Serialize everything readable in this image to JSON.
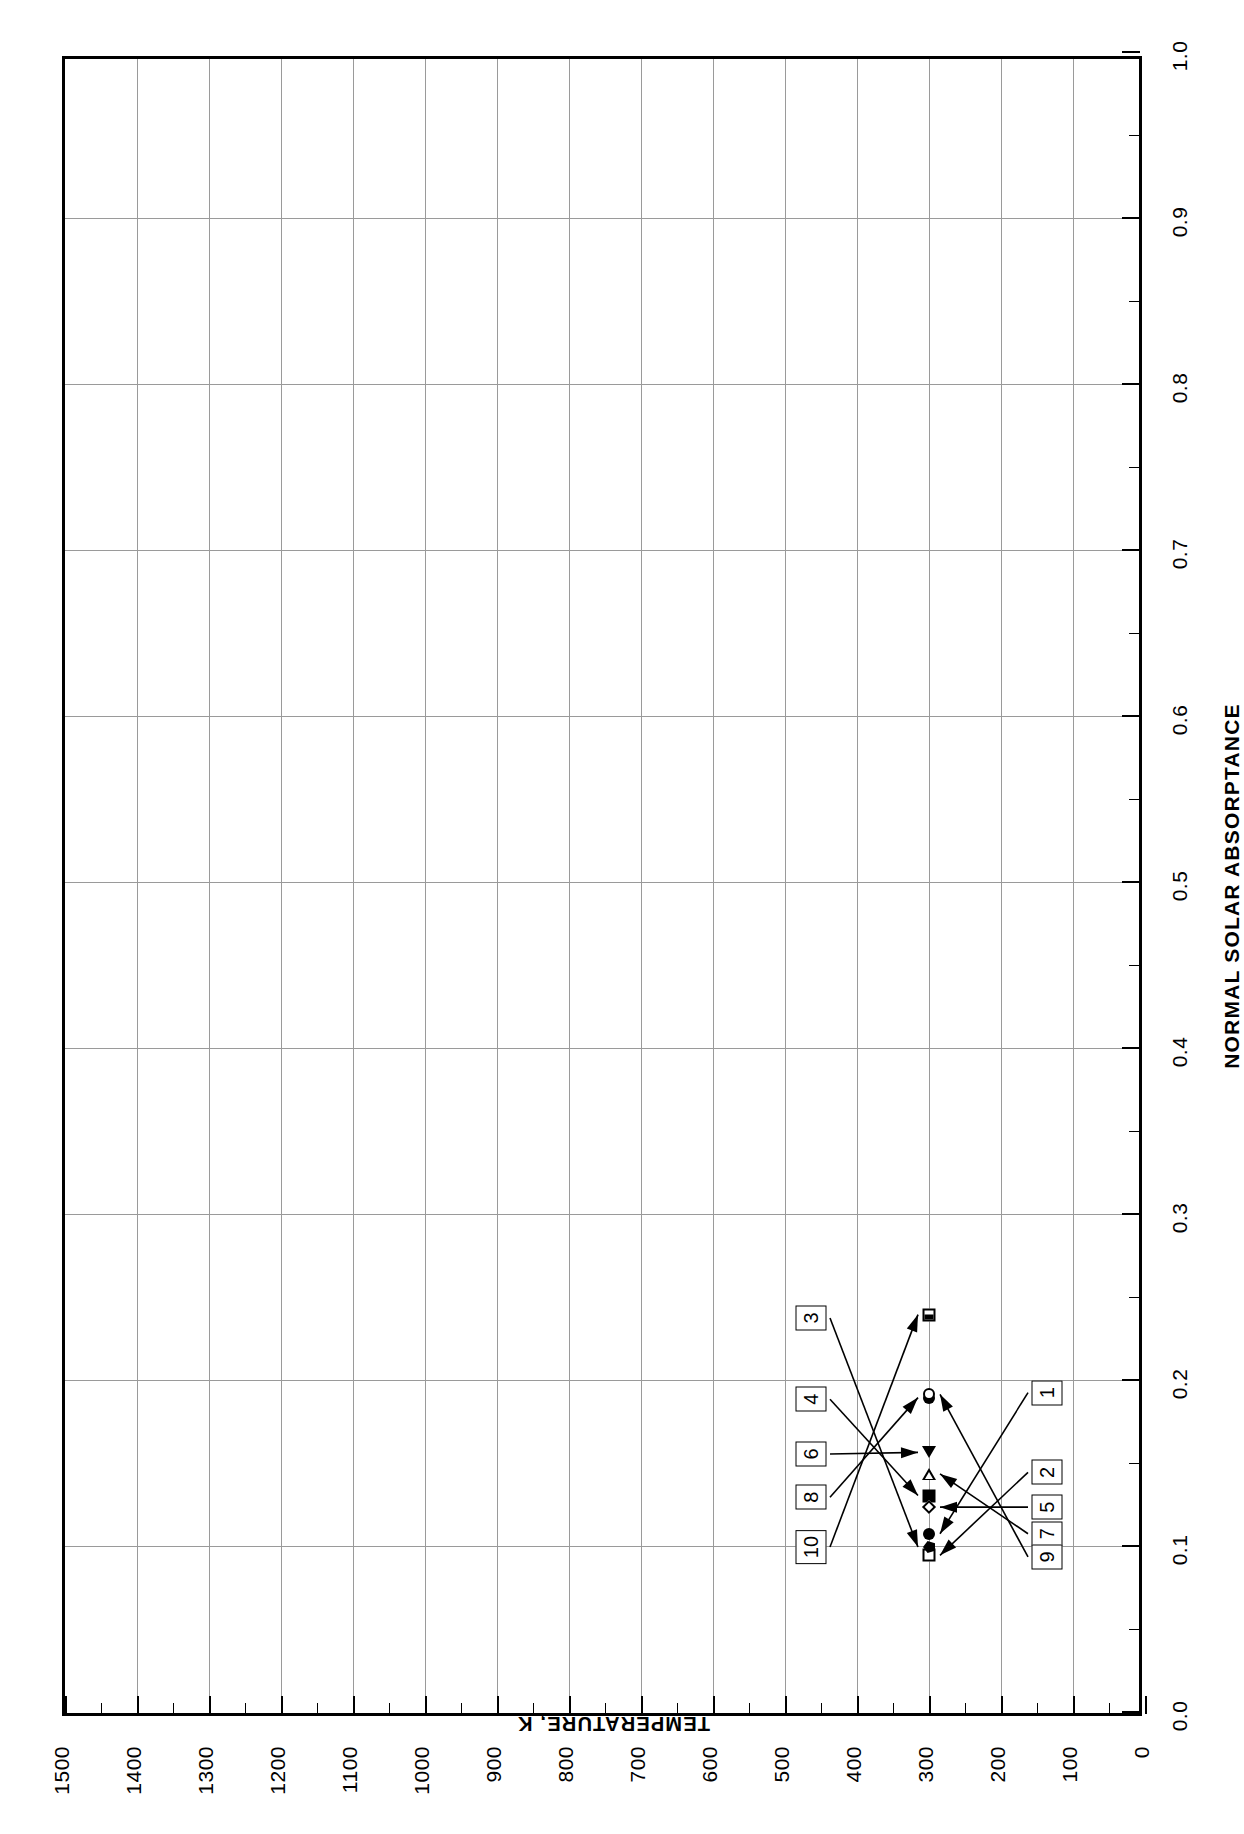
{
  "figure": {
    "number_label": "FIGURE 15",
    "title_lines": [
      "NORMAL",
      "SOLAR",
      "ABSORPTANCE OF",
      "ALUMINUM"
    ]
  },
  "axes": {
    "x_title": "NORMAL SOLAR ABSORPTANCE",
    "y_title": "TEMPERATURE, K",
    "x_tick_labels": [
      "0.0",
      "0.1",
      "0.2",
      "0.3",
      "0.4",
      "0.5",
      "0.6",
      "0.7",
      "0.8",
      "0.9",
      "1.0"
    ],
    "y_tick_labels": [
      "0",
      "100",
      "200",
      "300",
      "400",
      "500",
      "600",
      "700",
      "800",
      "900",
      "1000",
      "1100",
      "1200",
      "1300",
      "1400",
      "1500"
    ]
  },
  "chart_data": {
    "type": "scatter",
    "title": "NORMAL SOLAR ABSORPTANCE OF ALUMINUM",
    "subtitle": "FIGURE 15",
    "xlabel": "NORMAL SOLAR ABSORPTANCE",
    "ylabel": "TEMPERATURE, K",
    "xlim": [
      0.0,
      1.0
    ],
    "ylim": [
      0,
      1500
    ],
    "xticks": [
      0.0,
      0.1,
      0.2,
      0.3,
      0.4,
      0.5,
      0.6,
      0.7,
      0.8,
      0.9,
      1.0
    ],
    "yticks": [
      0,
      100,
      200,
      300,
      400,
      500,
      600,
      700,
      800,
      900,
      1000,
      1100,
      1200,
      1300,
      1400,
      1500
    ],
    "grid": true,
    "legend": "none",
    "orientation": "page rotated 90 degrees; absorptance axis horizontal at page bottom, temperature axis vertical at page right",
    "points": [
      {
        "curve": 1,
        "label": "1",
        "absorptance": 0.108,
        "temperature": 300,
        "marker": "filled-circle",
        "callout_side": "below"
      },
      {
        "curve": 2,
        "label": "2",
        "absorptance": 0.095,
        "temperature": 300,
        "marker": "open-square",
        "callout_side": "below"
      },
      {
        "curve": 3,
        "label": "3",
        "absorptance": 0.1,
        "temperature": 300,
        "marker": "filled-pentagon",
        "callout_side": "above"
      },
      {
        "curve": 4,
        "label": "4",
        "absorptance": 0.131,
        "temperature": 300,
        "marker": "filled-square",
        "callout_side": "above"
      },
      {
        "curve": 5,
        "label": "5",
        "absorptance": 0.124,
        "temperature": 300,
        "marker": "open-diamond",
        "callout_side": "below"
      },
      {
        "curve": 6,
        "label": "6",
        "absorptance": 0.157,
        "temperature": 300,
        "marker": "filled-triangle-left",
        "callout_side": "above"
      },
      {
        "curve": 7,
        "label": "7",
        "absorptance": 0.144,
        "temperature": 300,
        "marker": "open-triangle-right",
        "callout_side": "below"
      },
      {
        "curve": 8,
        "label": "8",
        "absorptance": 0.19,
        "temperature": 300,
        "marker": "filled-circle",
        "callout_side": "above"
      },
      {
        "curve": 9,
        "label": "9",
        "absorptance": 0.192,
        "temperature": 300,
        "marker": "open-circle",
        "callout_side": "below"
      },
      {
        "curve": 10,
        "label": "10",
        "absorptance": 0.24,
        "temperature": 300,
        "marker": "square-in-square",
        "callout_side": "above"
      }
    ],
    "callouts_above": [
      "10",
      "8",
      "6",
      "4",
      "3"
    ],
    "callouts_below": [
      "9",
      "7",
      "5",
      "1",
      "2"
    ]
  },
  "colors": {
    "ink": "#000000",
    "grid": "#9a9a9a",
    "paper": "#ffffff"
  }
}
